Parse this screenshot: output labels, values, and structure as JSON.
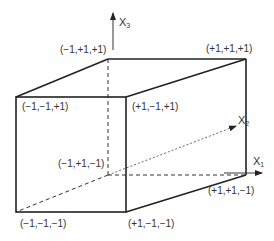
{
  "diagram": {
    "type": "unit cube in 3D coordinate space",
    "axes": {
      "x1": {
        "label": "X",
        "subscript": "1"
      },
      "x2": {
        "label": "X",
        "subscript": "2"
      },
      "x3": {
        "label": "X",
        "subscript": "3"
      }
    },
    "vertices": {
      "back_top_left": "(−1,+1,+1)",
      "back_top_right": "(+1,+1,+1)",
      "front_top_left": "(−1,−1,+1)",
      "front_top_right": "(+1,−1,+1)",
      "back_bottom_left": "(−1,+1,−1)",
      "back_bottom_right": "(+1,+1,−1)",
      "front_bottom_left": "(−1,−1,−1)",
      "front_bottom_right": "(+1,−1,−1)"
    },
    "colors": {
      "line": "#222222",
      "text": "#333333",
      "background": "#ffffff"
    }
  }
}
